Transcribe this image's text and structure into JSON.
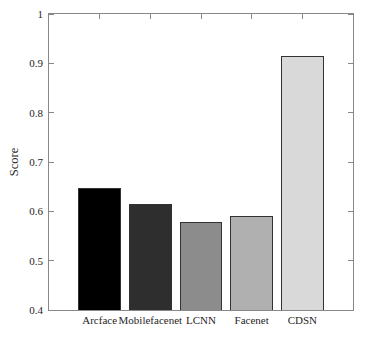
{
  "figure": {
    "background": "#ffffff",
    "axis_color": "#888888",
    "text_color": "#262626"
  },
  "chart_data": {
    "type": "bar",
    "categories": [
      "Arcface",
      "Mobilefacenet",
      "LCNN",
      "Facenet",
      "CDSN"
    ],
    "values": [
      0.647,
      0.615,
      0.578,
      0.59,
      0.915
    ],
    "bar_colors": [
      "#000000",
      "#2e2e2e",
      "#8c8c8c",
      "#b0b0b0",
      "#d9d9d9"
    ],
    "bar_edge_color": "#333333",
    "title": "",
    "xlabel": "",
    "ylabel": "Score",
    "ylim": [
      0.4,
      1.0
    ],
    "yticks": [
      0.4,
      0.5,
      0.6,
      0.7,
      0.8,
      0.9,
      1.0
    ],
    "ytick_labels": [
      "0.4",
      "0.5",
      "0.6",
      "0.7",
      "0.8",
      "0.9",
      "1"
    ],
    "grid": false,
    "legend": null,
    "box": true
  }
}
